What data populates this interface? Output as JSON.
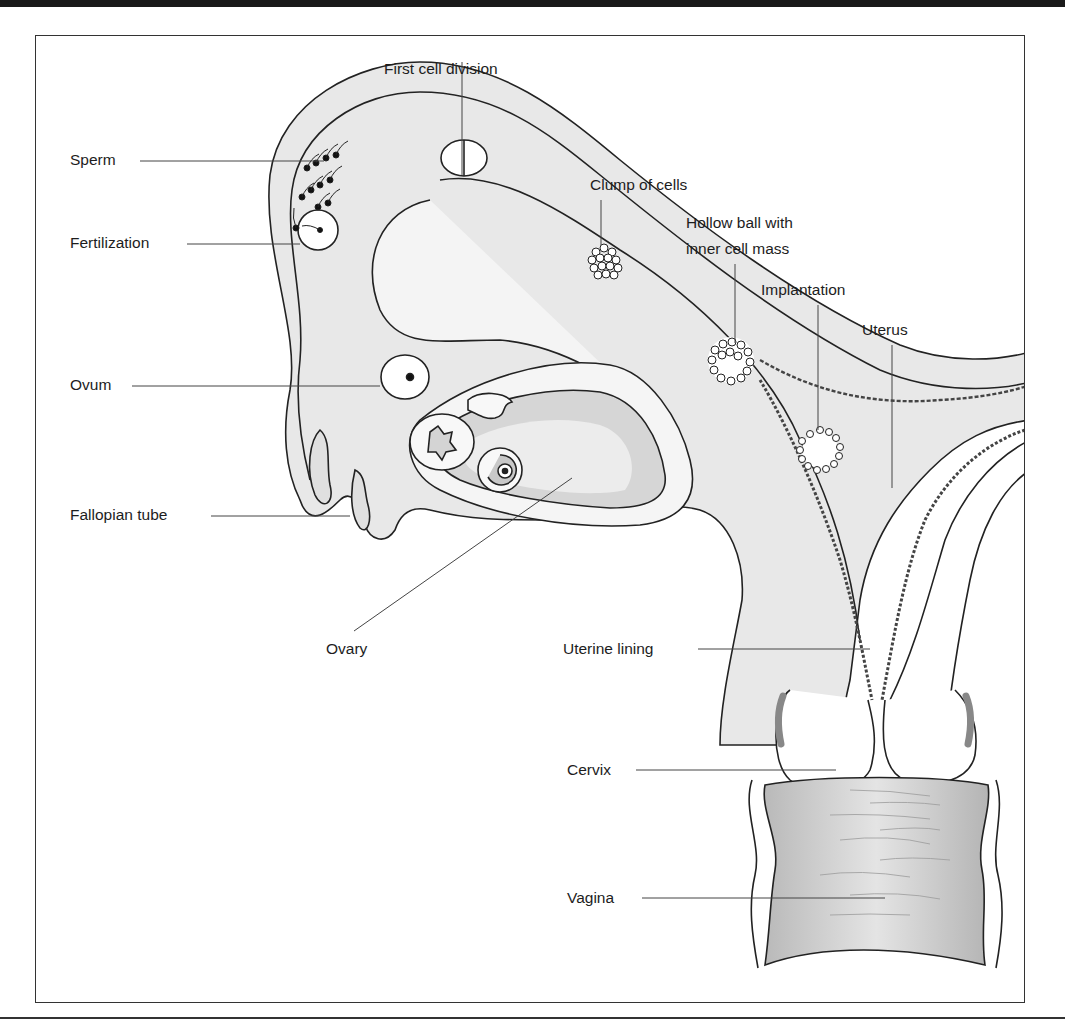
{
  "diagram": {
    "type": "anatomical-labeled-illustration",
    "labels": {
      "first_cell_division": "First cell division",
      "sperm": "Sperm",
      "fertilization": "Fertilization",
      "clump_of_cells": "Clump of cells",
      "hollow_ball_line1": "Hollow ball with",
      "hollow_ball_line2": "inner cell mass",
      "implantation": "Implantation",
      "uterus": "Uterus",
      "ovum": "Ovum",
      "fallopian_tube": "Fallopian tube",
      "ovary": "Ovary",
      "uterine_lining": "Uterine lining",
      "cervix": "Cervix",
      "vagina": "Vagina"
    },
    "colors": {
      "outline": "#222222",
      "tissue_light": "#e6e6e6",
      "tissue_mid": "#cfcfcf",
      "tissue_dark": "#a8a8a8",
      "leader_line": "#444444"
    }
  }
}
